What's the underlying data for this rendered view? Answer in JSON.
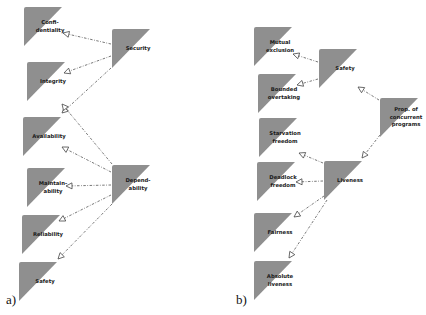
{
  "colors": {
    "node_fill": "#8f8f8f",
    "edge": "#555555",
    "arrow_fill": "#ffffff"
  },
  "panels": [
    {
      "label": "a)",
      "nodes": [
        {
          "id": "confidentiality",
          "lines": [
            "Confi-",
            "dentiality"
          ],
          "x": 24,
          "y": 7
        },
        {
          "id": "security",
          "lines": [
            "Security"
          ],
          "x": 112,
          "y": 29
        },
        {
          "id": "integrity",
          "lines": [
            "Integrity"
          ],
          "x": 27,
          "y": 62
        },
        {
          "id": "availability",
          "lines": [
            "Availability"
          ],
          "x": 23,
          "y": 117
        },
        {
          "id": "dependability",
          "lines": [
            "Depend-",
            "ability"
          ],
          "x": 112,
          "y": 165
        },
        {
          "id": "maintainability",
          "lines": [
            "Maintain-",
            "ability"
          ],
          "x": 27,
          "y": 168
        },
        {
          "id": "reliability",
          "lines": [
            "Reliability"
          ],
          "x": 22,
          "y": 215
        },
        {
          "id": "safety-a",
          "lines": [
            "Safety"
          ],
          "x": 19,
          "y": 262
        }
      ],
      "edges": [
        {
          "from": "security",
          "to": "confidentiality",
          "x1": 111,
          "y1": 44,
          "x2": 63,
          "y2": 33
        },
        {
          "from": "security",
          "to": "integrity",
          "x1": 111,
          "y1": 56,
          "x2": 64,
          "y2": 73
        },
        {
          "from": "security",
          "to": "availability",
          "x1": 111,
          "y1": 68,
          "x2": 62,
          "y2": 113
        },
        {
          "from": "dependability",
          "to": "confidentiality-availability",
          "x1": 112,
          "y1": 164,
          "x2": 62,
          "y2": 104
        },
        {
          "from": "dependability",
          "to": "availability",
          "x1": 111,
          "y1": 172,
          "x2": 62,
          "y2": 147
        },
        {
          "from": "dependability",
          "to": "maintainability",
          "x1": 111,
          "y1": 185,
          "x2": 66,
          "y2": 186
        },
        {
          "from": "dependability",
          "to": "reliability",
          "x1": 111,
          "y1": 195,
          "x2": 59,
          "y2": 221
        },
        {
          "from": "dependability",
          "to": "safety-a",
          "x1": 112,
          "y1": 204,
          "x2": 58,
          "y2": 259
        }
      ]
    },
    {
      "label": "b)",
      "nodes": [
        {
          "id": "mutual-exclusion",
          "lines": [
            "Mutual",
            "exclusion"
          ],
          "x": 254,
          "y": 27
        },
        {
          "id": "safety-b",
          "lines": [
            "Safety"
          ],
          "x": 319,
          "y": 49
        },
        {
          "id": "bounded-overtaking",
          "lines": [
            "Bounded",
            "overtaking"
          ],
          "x": 258,
          "y": 74
        },
        {
          "id": "prop-concurrent",
          "lines": [
            "Prop. of",
            "concurrent",
            "programs"
          ],
          "x": 380,
          "y": 98
        },
        {
          "id": "starvation-freedom",
          "lines": [
            "Starvation",
            "freedom"
          ],
          "x": 259,
          "y": 118
        },
        {
          "id": "deadlock-freedom",
          "lines": [
            "Deadlock",
            "freedom"
          ],
          "x": 257,
          "y": 162
        },
        {
          "id": "liveness",
          "lines": [
            "Liveness"
          ],
          "x": 324,
          "y": 161
        },
        {
          "id": "fairness",
          "lines": [
            "Fairness"
          ],
          "x": 254,
          "y": 213
        },
        {
          "id": "absolute-liveness",
          "lines": [
            "Absolute",
            "liveness"
          ],
          "x": 254,
          "y": 261
        }
      ],
      "edges": [
        {
          "from": "safety-b",
          "to": "mutual-exclusion",
          "x1": 318,
          "y1": 62,
          "x2": 293,
          "y2": 54
        },
        {
          "from": "safety-b",
          "to": "bounded-overtaking",
          "x1": 318,
          "y1": 79,
          "x2": 297,
          "y2": 85
        },
        {
          "from": "prop-concurrent",
          "to": "safety-b",
          "x1": 379,
          "y1": 100,
          "x2": 358,
          "y2": 87
        },
        {
          "from": "prop-concurrent",
          "to": "liveness",
          "x1": 380,
          "y1": 135,
          "x2": 362,
          "y2": 158
        },
        {
          "from": "liveness",
          "to": "starvation-freedom",
          "x1": 323,
          "y1": 163,
          "x2": 299,
          "y2": 153
        },
        {
          "from": "liveness",
          "to": "deadlock-freedom",
          "x1": 323,
          "y1": 181,
          "x2": 296,
          "y2": 182
        },
        {
          "from": "liveness",
          "to": "fairness",
          "x1": 324,
          "y1": 196,
          "x2": 294,
          "y2": 217
        },
        {
          "from": "liveness",
          "to": "absolute-liveness",
          "x1": 327,
          "y1": 200,
          "x2": 289,
          "y2": 258
        }
      ]
    }
  ]
}
